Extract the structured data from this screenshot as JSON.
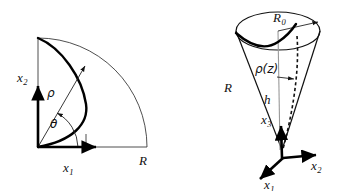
{
  "figure": {
    "background_color": "#ffffff",
    "ink_color": "#111111",
    "axis_color": "#000000",
    "guide_color": "#999999"
  },
  "left_panel": {
    "name": "quarter-disk-polar-diagram",
    "axes": [
      {
        "id": "x1",
        "label": "x",
        "subscript": "1",
        "direction": "right"
      },
      {
        "id": "x2",
        "label": "x",
        "subscript": "2",
        "direction": "up"
      }
    ],
    "labels": {
      "radial_coordinate": "ρ",
      "angular_coordinate": "θ",
      "outer_radius": "R"
    },
    "geometry": {
      "origin": [
        38,
        147
      ],
      "radius": 109,
      "sector_degrees": 90,
      "x1_axis_tip": [
        101,
        147
      ],
      "x2_axis_tip": [
        38,
        82
      ],
      "rho_arrow_tip": [
        86,
        64
      ],
      "theta_arc_degrees": 55
    }
  },
  "right_panel": {
    "name": "cone-coordinate-diagram",
    "axes": [
      {
        "id": "x1",
        "label": "x",
        "subscript": "1",
        "direction": "front-left"
      },
      {
        "id": "x2",
        "label": "x",
        "subscript": "2",
        "direction": "right"
      },
      {
        "id": "x3",
        "label": "x",
        "subscript": "3",
        "direction": "up"
      }
    ],
    "labels": {
      "top_radius": "R",
      "top_radius_subscript": "0",
      "slant_length": "R",
      "height": "h",
      "radius_function": "ρ(z)"
    },
    "geometry": {
      "apex": [
        282,
        150
      ],
      "ellipse_center": [
        278,
        31
      ],
      "ellipse_rx": 42,
      "ellipse_ry": 19,
      "origin_3d": [
        283,
        158
      ],
      "x1_axis_tip": [
        256,
        183
      ],
      "x2_axis_tip": [
        321,
        154
      ],
      "x3_axis_tip": [
        281,
        122
      ],
      "rho_z_arrow_from": [
        276,
        76
      ],
      "rho_z_arrow_to": [
        296,
        76
      ]
    }
  }
}
